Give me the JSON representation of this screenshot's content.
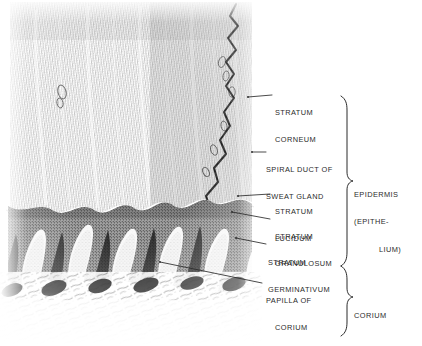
{
  "figure": {
    "ink_color": "#2b2b2b",
    "background_color": "#ffffff"
  },
  "labels": [
    {
      "id": "stratum-corneum",
      "line1": "STRATUM",
      "line2": "CORNEUM"
    },
    {
      "id": "spiral-duct",
      "line1": "SPIRAL DUCT OF",
      "line2": "SWEAT GLAND"
    },
    {
      "id": "stratum-lucidum",
      "line1": "STRATUM",
      "line2": "LUCIDUM"
    },
    {
      "id": "stratum-granulosum",
      "line1": "STRATUM",
      "line2": "GRANULOSUM"
    },
    {
      "id": "stratum-germinativum",
      "line1": "STRATUM",
      "line2": "GERMINATIVUM"
    },
    {
      "id": "papilla-of-corium",
      "line1": "PAPILLA OF",
      "line2": "CORIUM"
    }
  ],
  "brackets": [
    {
      "id": "epidermis",
      "line1": "EPIDERMIS",
      "line2": "(EPITHE-",
      "line3": "LIUM)"
    },
    {
      "id": "corium",
      "line1": "CORIUM",
      "line2": "",
      "line3": ""
    }
  ]
}
